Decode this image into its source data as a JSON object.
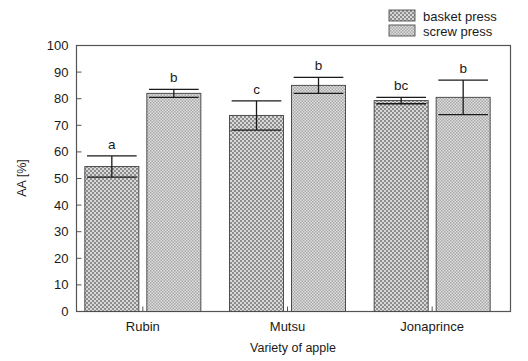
{
  "chart_data": {
    "type": "bar",
    "title": "",
    "subtitle": "",
    "xlabel": "Variety of apple",
    "ylabel": "AA [%]",
    "categories": [
      "Rubin",
      "Mutsu",
      "Jonaprince"
    ],
    "ylim": [
      0,
      100
    ],
    "yticks": [
      0,
      10,
      20,
      30,
      40,
      50,
      60,
      70,
      80,
      90,
      100
    ],
    "ytick_labels": [
      "0",
      "10",
      "20",
      "30",
      "40",
      "50",
      "60",
      "70",
      "80",
      "90",
      "100"
    ],
    "grid": false,
    "legend_position": "top-right",
    "series": [
      {
        "name": "basket press",
        "pattern": "checker-dots",
        "color": "#b4b4b4",
        "values": [
          54.5,
          73.7,
          79.3
        ],
        "errors": [
          4.0,
          5.5,
          1.2
        ],
        "sig_letters": [
          "a",
          "c",
          "bc"
        ]
      },
      {
        "name": "screw press",
        "pattern": "fine-crosshatch",
        "color": "#c9c9c9",
        "values": [
          82.0,
          85.0,
          80.5
        ],
        "errors": [
          1.5,
          3.0,
          6.5
        ],
        "sig_letters": [
          "b",
          "b",
          "b"
        ]
      }
    ]
  },
  "legend": {
    "items": [
      {
        "label": "basket press"
      },
      {
        "label": "screw press"
      }
    ]
  },
  "axes": {
    "y_title": "AA [%]",
    "x_title": "Variety of apple"
  },
  "colors": {
    "frame": "#555555",
    "bar_outline": "#4d4d4d",
    "basket_fill": "#b4b4b4",
    "screw_fill": "#c9c9c9",
    "text": "#1a1a1a"
  }
}
